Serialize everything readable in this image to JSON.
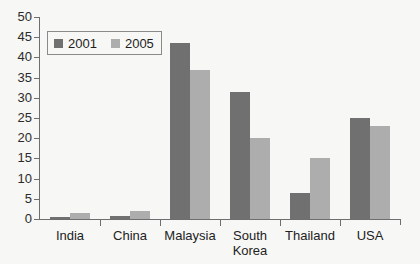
{
  "chart_data": {
    "type": "bar",
    "title": "",
    "subtitle": "",
    "xlabel": "",
    "ylabel": "",
    "categories": [
      "India",
      "China",
      "Malaysia",
      "South Korea",
      "Thailand",
      "USA"
    ],
    "series": [
      {
        "name": "2001",
        "color": "#707070",
        "values": [
          0.5,
          0.8,
          43.5,
          31.5,
          6.5,
          25
        ]
      },
      {
        "name": "2005",
        "color": "#adadad",
        "values": [
          1.5,
          2,
          37,
          20,
          15,
          23
        ]
      }
    ],
    "ylim": [
      0,
      50
    ],
    "yticks": [
      0,
      5,
      10,
      15,
      20,
      25,
      30,
      35,
      40,
      45,
      50
    ],
    "ytick_labels": [
      "0",
      "5",
      "10",
      "15",
      "20",
      "25",
      "30",
      "35",
      "40",
      "45",
      "50"
    ],
    "grid": false,
    "legend": {
      "position": "top-left",
      "entries": [
        "2001",
        "2005"
      ]
    }
  },
  "colors": {
    "background": "#f7f7f5",
    "axis": "#6e6e6e",
    "text": "#222222",
    "series_2001": "#707070",
    "series_2005": "#adadad"
  }
}
